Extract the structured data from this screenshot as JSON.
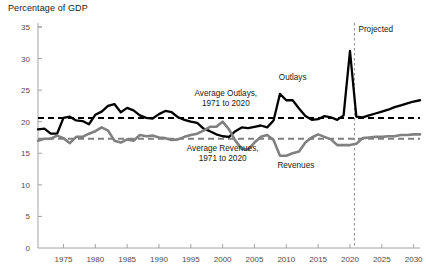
{
  "chart_data": {
    "type": "line",
    "title": "",
    "ylabel": "Percentage of GDP",
    "xlabel": "",
    "ylim": [
      0,
      35
    ],
    "xlim": [
      1971,
      2031
    ],
    "grid": false,
    "legend_position": "inline-annotations",
    "y_ticks": [
      0,
      5,
      10,
      15,
      20,
      25,
      30,
      35
    ],
    "x_ticks": [
      1975,
      1980,
      1985,
      1990,
      1995,
      2000,
      2005,
      2010,
      2015,
      2020,
      2025,
      2030
    ],
    "x": [
      1971,
      1972,
      1973,
      1974,
      1975,
      1976,
      1977,
      1978,
      1979,
      1980,
      1981,
      1982,
      1983,
      1984,
      1985,
      1986,
      1987,
      1988,
      1989,
      1990,
      1991,
      1992,
      1993,
      1994,
      1995,
      1996,
      1997,
      1998,
      1999,
      2000,
      2001,
      2002,
      2003,
      2004,
      2005,
      2006,
      2007,
      2008,
      2009,
      2010,
      2011,
      2012,
      2013,
      2014,
      2015,
      2016,
      2017,
      2018,
      2019,
      2020,
      2021,
      2022,
      2023,
      2024,
      2025,
      2026,
      2027,
      2028,
      2029,
      2030,
      2031
    ],
    "series": [
      {
        "name": "Outlays",
        "color": "#000000",
        "style": "solid",
        "values": [
          18.8,
          18.9,
          18.1,
          18.1,
          20.6,
          20.8,
          20.2,
          20.1,
          19.6,
          21.1,
          21.6,
          22.5,
          22.8,
          21.5,
          22.2,
          21.8,
          21.0,
          20.6,
          20.5,
          21.2,
          21.7,
          21.5,
          20.7,
          20.3,
          20.0,
          19.8,
          18.9,
          18.5,
          18.0,
          17.7,
          17.6,
          18.5,
          19.1,
          19.0,
          19.2,
          19.4,
          19.1,
          20.2,
          24.4,
          23.4,
          23.4,
          22.1,
          20.9,
          20.3,
          20.4,
          20.9,
          20.7,
          20.3,
          21.0,
          31.2,
          20.8,
          20.7,
          21.0,
          21.3,
          21.6,
          21.9,
          22.3,
          22.6,
          22.9,
          23.2,
          23.4
        ]
      },
      {
        "name": "Revenues",
        "color": "#808080",
        "style": "solid",
        "values": [
          17.0,
          17.3,
          17.3,
          17.8,
          17.4,
          16.6,
          17.6,
          17.6,
          18.1,
          18.5,
          19.1,
          18.6,
          17.0,
          16.7,
          17.2,
          17.0,
          17.9,
          17.7,
          17.8,
          17.5,
          17.4,
          17.1,
          17.2,
          17.6,
          17.9,
          18.1,
          18.6,
          19.2,
          19.2,
          20.0,
          18.8,
          17.0,
          15.7,
          15.6,
          16.7,
          17.6,
          17.9,
          17.1,
          14.6,
          14.6,
          15.0,
          15.3,
          16.7,
          17.5,
          18.0,
          17.6,
          17.2,
          16.3,
          16.3,
          16.3,
          16.5,
          17.4,
          17.5,
          17.6,
          17.6,
          17.7,
          17.7,
          17.9,
          17.9,
          18.0,
          18.0
        ]
      }
    ],
    "reference_lines": [
      {
        "name": "Average Outlays, 1971 to 2020",
        "value": 20.6,
        "color": "#000000",
        "style": "dashed",
        "label_lines": [
          "Average Outlays,",
          "1971 to 2020"
        ]
      },
      {
        "name": "Average Revenues, 1971 to 2020",
        "value": 17.3,
        "color": "#808080",
        "style": "dashed",
        "label_lines": [
          "Average Revenues,",
          "1971 to 2020"
        ]
      }
    ],
    "vertical_marker": {
      "name": "projection-divider",
      "value": 2020.7,
      "label": "Projected",
      "color": "#808080",
      "style": "dashed"
    },
    "annotations": [
      {
        "name": "outlays-label",
        "text": "Outlays",
        "x": 2011,
        "y": 26.6
      },
      {
        "name": "revenues-label",
        "text": "Revenues",
        "x": 2011.5,
        "y": 12.6
      }
    ]
  }
}
